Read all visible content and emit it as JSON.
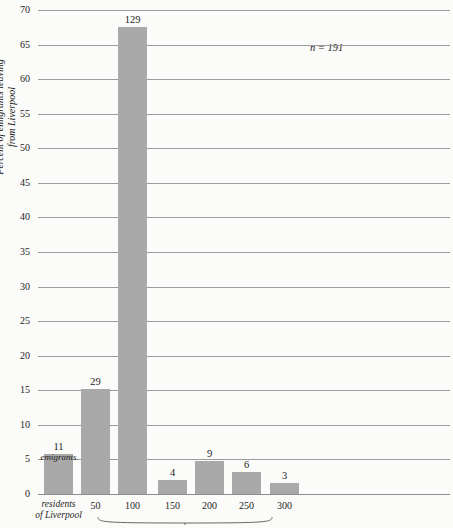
{
  "chart_data": {
    "type": "bar",
    "title": "",
    "xlabel": "",
    "ylabel": "Percent of emigrants leaving from Liverpool",
    "ylabel_line1": "Percent of emigrants leaving",
    "ylabel_line2": "from Liverpool",
    "ylim": [
      0,
      70
    ],
    "ytick_step": 5,
    "yticks": [
      0,
      5,
      10,
      15,
      20,
      25,
      30,
      35,
      40,
      45,
      50,
      55,
      60,
      65,
      70
    ],
    "ytick_labels": [
      "0",
      "5",
      "10",
      "15",
      "20",
      "25",
      "30",
      "35",
      "40",
      "45",
      "50",
      "55",
      "60",
      "65",
      "70"
    ],
    "grid": true,
    "legend": "none",
    "categories": [
      "residents of Liverpool",
      "50",
      "100",
      "150",
      "200",
      "250",
      "300"
    ],
    "xtick_labels": [
      "50",
      "100",
      "150",
      "200",
      "250",
      "300"
    ],
    "xcat_label_line1": "residents",
    "xcat_label_line2": "of Liverpool",
    "values": [
      5.76,
      15.18,
      67.54,
      2.09,
      4.71,
      3.14,
      1.57
    ],
    "counts": [
      11,
      29,
      129,
      4,
      9,
      6,
      3
    ],
    "count_labels": [
      "11",
      "29",
      "129",
      "4",
      "9",
      "6",
      "3"
    ],
    "first_bar_sublabel": "emigrants",
    "annotations": [
      {
        "text": "n = 191",
        "x": 0.66,
        "y": 64.5
      }
    ],
    "bar_color": "#a9a9a9",
    "grid_color": "#9b9b9b",
    "background_color": "#fbfbf9"
  }
}
